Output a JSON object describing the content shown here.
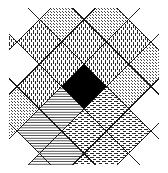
{
  "figure": {
    "type": "argyle-diamond-lattice",
    "canvas": {
      "width": 168,
      "height": 173,
      "background": "#ffffff"
    },
    "stroke": {
      "color": "#1a1a1a",
      "width": 1.1
    },
    "grid": {
      "rotation_deg": 45,
      "cell_pitch_px": 31.5,
      "cols": 7,
      "rows": 7,
      "origin_x": 84,
      "origin_y": 86.5,
      "clip": {
        "x": 9,
        "y": 8,
        "width": 150,
        "height": 157
      }
    },
    "palette": {
      "ink": "#1a1a1a",
      "paper": "#ffffff",
      "solid_cell": "#000000",
      "light_gray": "#c9c9c9",
      "mid_gray": "#9a9a9a"
    },
    "fill_legend": [
      {
        "key": "blank",
        "label": "blank / white"
      },
      {
        "key": "stipple",
        "label": "stipple dots"
      },
      {
        "key": "vdash",
        "label": "vertical dashes"
      },
      {
        "key": "hdash",
        "label": "horizontal dashes"
      },
      {
        "key": "hline",
        "label": "horizontal lines"
      },
      {
        "key": "solid",
        "label": "solid black"
      }
    ],
    "cells": [
      [
        "blank",
        "blank",
        "blank",
        "blank",
        "blank",
        "blank",
        "blank"
      ],
      [
        "blank",
        "blank",
        "stipple",
        "vdash",
        "stipple",
        "blank",
        "blank"
      ],
      [
        "blank",
        "stipple",
        "vdash",
        "vdash",
        "stipple",
        "blank",
        "blank"
      ],
      [
        "blank",
        "vdash",
        "vdash",
        "solid",
        "hdash",
        "hdash",
        "blank"
      ],
      [
        "vdash",
        "blank",
        "vdash",
        "hline",
        "hdash",
        "hdash",
        "blank"
      ],
      [
        "blank",
        "blank",
        "stipple",
        "hline",
        "hline",
        "hdash",
        "blank"
      ],
      [
        "blank",
        "blank",
        "stipple",
        "blank",
        "hline",
        "blank",
        "blank"
      ]
    ],
    "cell_count": 49,
    "solid_cell_index": {
      "row": 3,
      "col": 3
    }
  }
}
